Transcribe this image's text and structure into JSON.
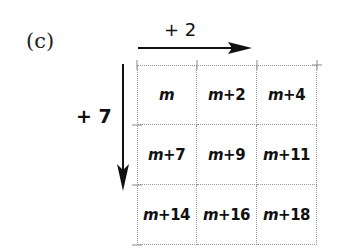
{
  "label": "(c)",
  "horizontal_step": "+ 2",
  "vertical_step": "+ 7",
  "variable": "m",
  "cells": [
    [
      {
        "var": "m",
        "offset": ""
      },
      {
        "var": "m",
        "offset": "+2"
      },
      {
        "var": "m",
        "offset": "+4"
      }
    ],
    [
      {
        "var": "m",
        "offset": "+7"
      },
      {
        "var": "m",
        "offset": "+9"
      },
      {
        "var": "m",
        "offset": "+11"
      }
    ],
    [
      {
        "var": "m",
        "offset": "+14"
      },
      {
        "var": "m",
        "offset": "+16"
      },
      {
        "var": "m",
        "offset": "+18"
      }
    ]
  ]
}
